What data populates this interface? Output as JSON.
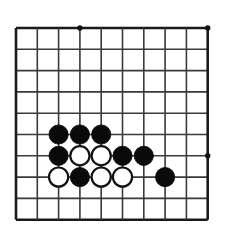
{
  "diagram": {
    "type": "go-board-diagram",
    "board": {
      "columns": 10,
      "rows": 10,
      "origin_x": 16,
      "origin_y": 28,
      "spacing": 21.3,
      "line_color": "#3a3a3a",
      "border_color": "#1a1a1a",
      "background_color": "#ffffff",
      "stone_radius": 9.6
    },
    "star_points": [
      {
        "col": 3,
        "row": 0
      },
      {
        "col": 9,
        "row": 0
      },
      {
        "col": 9,
        "row": 6
      }
    ],
    "stones": [
      {
        "color": "black",
        "col": 2,
        "row": 5
      },
      {
        "color": "black",
        "col": 3,
        "row": 5
      },
      {
        "color": "black",
        "col": 4,
        "row": 5
      },
      {
        "color": "black",
        "col": 2,
        "row": 6
      },
      {
        "color": "white",
        "col": 3,
        "row": 6
      },
      {
        "color": "white",
        "col": 4,
        "row": 6
      },
      {
        "color": "black",
        "col": 5,
        "row": 6
      },
      {
        "color": "black",
        "col": 6,
        "row": 6
      },
      {
        "color": "white",
        "col": 2,
        "row": 7
      },
      {
        "color": "black",
        "col": 3,
        "row": 7
      },
      {
        "color": "white",
        "col": 4,
        "row": 7
      },
      {
        "color": "white",
        "col": 5,
        "row": 7
      },
      {
        "color": "black",
        "col": 7,
        "row": 7
      }
    ],
    "counts": {
      "black_stones": 9,
      "white_stones": 4,
      "total_stones": 13
    }
  }
}
